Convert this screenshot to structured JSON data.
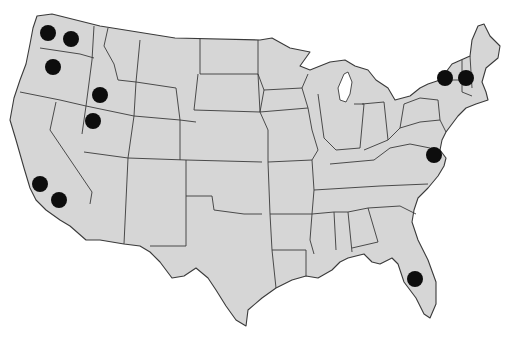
{
  "map": {
    "title": "",
    "region": "Contiguous United States",
    "style": {
      "land_color": "#d6d6d6",
      "border_color": "#3a3a3a",
      "marker_color": "#0d0d0d",
      "background": "#ffffff"
    },
    "markers": [
      {
        "id": "wa-west",
        "state": "Washington",
        "x": 48,
        "y": 33,
        "r": 8
      },
      {
        "id": "wa-east",
        "state": "Washington",
        "x": 71,
        "y": 39,
        "r": 8
      },
      {
        "id": "or",
        "state": "Oregon",
        "x": 53,
        "y": 67,
        "r": 8
      },
      {
        "id": "id",
        "state": "Idaho",
        "x": 100,
        "y": 95,
        "r": 8
      },
      {
        "id": "nv-ut",
        "state": "Nevada/Utah",
        "x": 93,
        "y": 121,
        "r": 8
      },
      {
        "id": "ca-north",
        "state": "California",
        "x": 40,
        "y": 184,
        "r": 8
      },
      {
        "id": "ca-south",
        "state": "California",
        "x": 59,
        "y": 200,
        "r": 8
      },
      {
        "id": "ny",
        "state": "New York",
        "x": 445,
        "y": 78,
        "r": 8
      },
      {
        "id": "nh-vt",
        "state": "New Hampshire/Vermont",
        "x": 466,
        "y": 78,
        "r": 8
      },
      {
        "id": "va",
        "state": "Virginia",
        "x": 434,
        "y": 155,
        "r": 8
      },
      {
        "id": "fl",
        "state": "Florida",
        "x": 415,
        "y": 279,
        "r": 8
      }
    ]
  }
}
